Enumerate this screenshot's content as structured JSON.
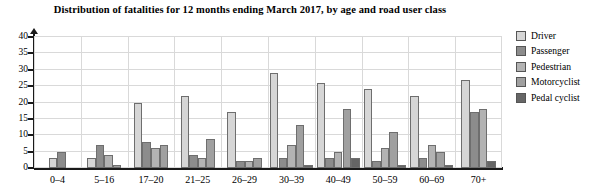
{
  "chart_data": {
    "type": "bar",
    "title": "Distribution of fatalities for 12 months ending March 2017, by age and road user class",
    "xlabel": "",
    "ylabel": "",
    "ylim": [
      0,
      40
    ],
    "yticks": [
      0,
      5,
      10,
      15,
      20,
      25,
      30,
      35,
      40
    ],
    "grid": true,
    "legend_position": "right",
    "categories": [
      "0–4",
      "5–16",
      "17–20",
      "21–25",
      "26–29",
      "30–39",
      "40–49",
      "50–59",
      "60–69",
      "70+"
    ],
    "series": [
      {
        "name": "Driver",
        "color": "#d6d6d6",
        "values": [
          3,
          3,
          20,
          22,
          17,
          29,
          26,
          24,
          22,
          27
        ]
      },
      {
        "name": "Passenger",
        "color": "#8c8c8c",
        "values": [
          5,
          7,
          8,
          4,
          2,
          3,
          3,
          2,
          3,
          17
        ]
      },
      {
        "name": "Pedestrian",
        "color": "#b3b3b3",
        "values": [
          0,
          4,
          6,
          3,
          2,
          7,
          5,
          6,
          7,
          18
        ]
      },
      {
        "name": "Motorcyclist",
        "color": "#a0a0a0",
        "values": [
          0,
          1,
          7,
          9,
          3,
          13,
          18,
          11,
          5,
          0
        ]
      },
      {
        "name": "Pedal cyclist",
        "color": "#666666",
        "values": [
          0,
          0,
          0,
          0,
          0,
          1,
          3,
          1,
          1,
          2
        ]
      }
    ]
  },
  "legend": {
    "items": [
      {
        "label": "Driver"
      },
      {
        "label": "Passenger"
      },
      {
        "label": "Pedestrian"
      },
      {
        "label": "Motorcyclist"
      },
      {
        "label": "Pedal cyclist"
      }
    ]
  }
}
